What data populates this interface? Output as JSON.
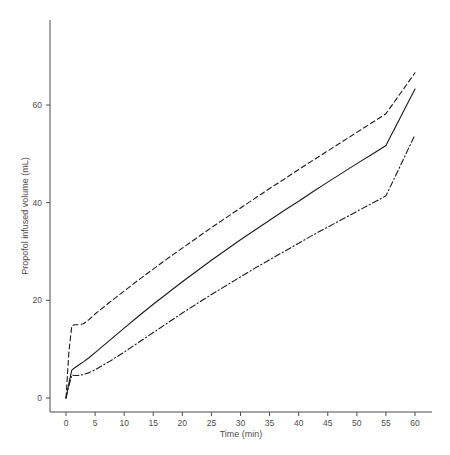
{
  "chart_data": {
    "type": "line",
    "title": "",
    "subtitle": "",
    "xlabel": "Time (min)",
    "ylabel": "Propofol infused volume (mL)",
    "xlim": [
      -2,
      63
    ],
    "ylim": [
      -3,
      72
    ],
    "xticks": [
      0,
      5,
      10,
      15,
      20,
      25,
      30,
      35,
      40,
      45,
      50,
      55,
      60
    ],
    "yticks": [
      0,
      20,
      40,
      60
    ],
    "xtick_labels": [
      "0",
      "5",
      "10",
      "15",
      "20",
      "25",
      "30",
      "35",
      "40",
      "45",
      "50",
      "55",
      "60"
    ],
    "ytick_labels": [
      "0",
      "20",
      "40",
      "60"
    ],
    "grid": false,
    "legend": "none",
    "line_color": "#1a1a1a",
    "axis_color": "#4d4d4d",
    "background": "#ffffff",
    "x": [
      0,
      0.5,
      1,
      1.5,
      2,
      3,
      4,
      5,
      7.5,
      10,
      12.5,
      15,
      17.5,
      20,
      22.5,
      25,
      27.5,
      30,
      32.5,
      35,
      37.5,
      40,
      42.5,
      45,
      47.5,
      50,
      52.5,
      55,
      57.5,
      60
    ],
    "series": [
      {
        "name": "upper-bound-dashed",
        "style": "dashed",
        "values": [
          0,
          9.5,
          14.8,
          15.0,
          15.0,
          15.2,
          16.1,
          17.2,
          19.6,
          21.9,
          24.2,
          26.4,
          28.6,
          30.7,
          32.8,
          34.9,
          36.9,
          38.9,
          40.9,
          42.9,
          44.8,
          46.8,
          48.7,
          50.6,
          52.5,
          54.4,
          56.3,
          58.2,
          62.4,
          66.6
        ]
      },
      {
        "name": "mean-solid",
        "style": "solid",
        "values": [
          0,
          3.0,
          5.7,
          6.2,
          6.6,
          7.4,
          8.3,
          9.3,
          11.8,
          14.3,
          16.8,
          19.2,
          21.5,
          23.8,
          26.0,
          28.2,
          30.3,
          32.4,
          34.4,
          36.4,
          38.4,
          40.3,
          42.3,
          44.2,
          46.1,
          48.0,
          49.8,
          51.7,
          57.5,
          63.3
        ]
      },
      {
        "name": "lower-bound-dashdot",
        "style": "dashdot",
        "values": [
          0,
          2.5,
          4.7,
          4.6,
          4.6,
          4.8,
          5.2,
          5.8,
          7.5,
          9.4,
          11.4,
          13.4,
          15.4,
          17.4,
          19.3,
          21.2,
          23.0,
          24.8,
          26.6,
          28.3,
          30.0,
          31.7,
          33.4,
          35.0,
          36.6,
          38.2,
          39.8,
          41.4,
          47.6,
          53.9
        ]
      }
    ],
    "annotations": []
  }
}
